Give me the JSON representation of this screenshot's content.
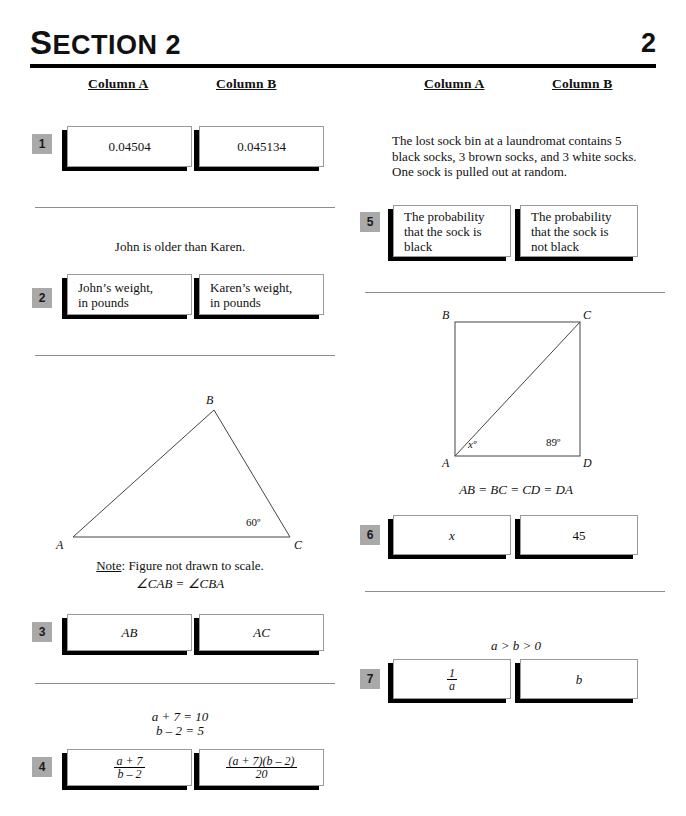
{
  "header": {
    "section_title_cap": "S",
    "section_title_rest": "ECTION 2",
    "page_number": "2"
  },
  "columns": {
    "left": {
      "column_a": "Column A",
      "column_b": "Column B"
    },
    "right": {
      "column_a": "Column A",
      "column_b": "Column B"
    }
  },
  "questions": [
    {
      "number": "1",
      "column_a": "0.04504",
      "column_b": "0.045134"
    },
    {
      "number": "2",
      "stem": "John is older than Karen.",
      "column_a_line1": "John’s weight,",
      "column_a_line2": "in pounds",
      "column_b_line1": "Karen’s weight,",
      "column_b_line2": "in pounds"
    },
    {
      "number": "3",
      "figure": {
        "type": "triangle",
        "vertex_a": "A",
        "vertex_b": "B",
        "vertex_c": "C",
        "angle_c": "60º"
      },
      "note_label": "Note",
      "note_text": ": Figure not drawn to scale.",
      "given": "∠CAB = ∠CBA",
      "column_a": "AB",
      "column_b": "AC"
    },
    {
      "number": "4",
      "given_line1": "a + 7 = 10",
      "given_line2": "b – 2 = 5",
      "column_a_num": "a + 7",
      "column_a_den": "b – 2",
      "column_b_num": "(a + 7)(b – 2)",
      "column_b_den": "20"
    },
    {
      "number": "5",
      "stem_line1": "The lost sock bin at a laundromat contains 5",
      "stem_line2": "black socks, 3 brown socks, and 3 white socks.",
      "stem_line3": "One sock is pulled out at random.",
      "column_a_line1": "The probability",
      "column_a_line2": "that the sock is",
      "column_a_line3": "black",
      "column_b_line1": "The probability",
      "column_b_line2": "that the sock is",
      "column_b_line3": "not black"
    },
    {
      "number": "6",
      "figure": {
        "type": "square-with-diagonal",
        "vertex_a": "A",
        "vertex_b": "B",
        "vertex_c": "C",
        "vertex_d": "D",
        "angle_x": "xº",
        "angle_d": "89º"
      },
      "given": "AB = BC = CD = DA",
      "column_a": "x",
      "column_b": "45"
    },
    {
      "number": "7",
      "given": "a > b > 0",
      "column_a_num": "1",
      "column_a_den": "a",
      "column_b": "b"
    }
  ],
  "colors": {
    "badge_gray": "#a9a9a9",
    "rule_black": "#000000",
    "divider_gray": "#8d8d8d",
    "box_border": "#9a9a9a"
  }
}
